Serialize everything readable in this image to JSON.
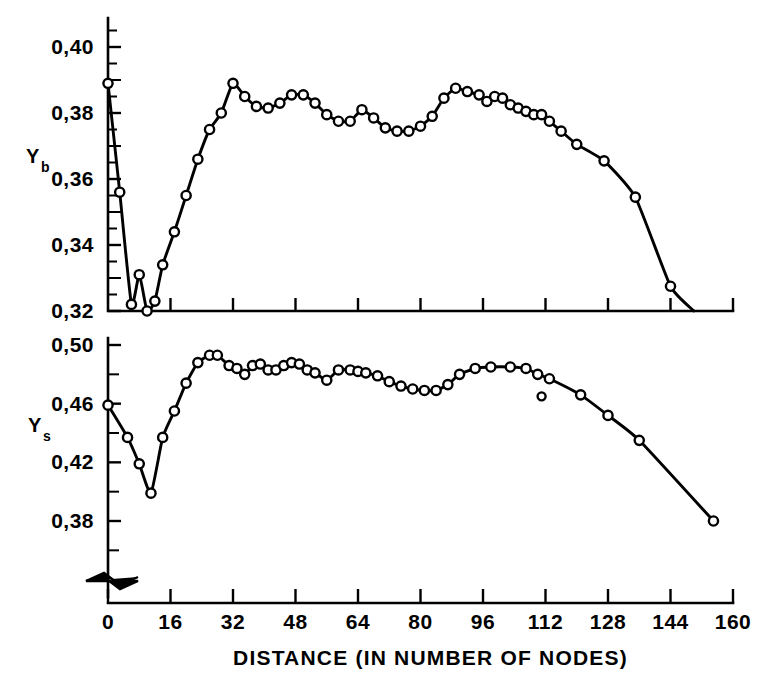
{
  "figure": {
    "background_color": "#ffffff",
    "line_color": "#000000",
    "marker_fill_color": "#ffffff"
  },
  "xaxis": {
    "title": "DISTANCE (IN NUMBER OF NODES)",
    "tick_labels": [
      "0",
      "16",
      "32",
      "48",
      "64",
      "80",
      "96",
      "112",
      "128",
      "144",
      "160"
    ],
    "tick_values": [
      0,
      16,
      32,
      48,
      64,
      80,
      96,
      112,
      128,
      144,
      160
    ],
    "range": [
      0,
      160
    ]
  },
  "panels": {
    "top": {
      "axis_label_main": "Y",
      "axis_label_sub": "b",
      "tick_labels": [
        "0,40",
        "0,38",
        "0,36",
        "0,34",
        "0,32"
      ],
      "tick_values": [
        0.4,
        0.38,
        0.36,
        0.34,
        0.32
      ],
      "range": [
        0.32,
        0.408
      ],
      "minor_tick_step": 0.01
    },
    "bottom": {
      "axis_label_main": "Y",
      "axis_label_sub": "s",
      "tick_labels": [
        "0,50",
        "0,46",
        "0,42",
        "0,38"
      ],
      "tick_values": [
        0.5,
        0.46,
        0.42,
        0.38
      ],
      "range": [
        0.355,
        0.503
      ],
      "minor_tick_step": 0.02,
      "axis_break": "zigzag-break"
    }
  },
  "chart_data": [
    {
      "type": "line",
      "title": "",
      "name": "Yb versus distance",
      "xlabel": "DISTANCE (IN NUMBER OF NODES)",
      "ylabel": "Yb",
      "xlim": [
        0,
        160
      ],
      "ylim": [
        0.32,
        0.408
      ],
      "grid": false,
      "legend": "none",
      "marker": "open-circle",
      "x": [
        0,
        3,
        6,
        8,
        10,
        12,
        14,
        17,
        20,
        23,
        26,
        29,
        32,
        35,
        38,
        41,
        44,
        47,
        50,
        53,
        56,
        59,
        62,
        65,
        68,
        71,
        74,
        77,
        80,
        83,
        86,
        89,
        92,
        95,
        97,
        99,
        101,
        103,
        105,
        107,
        109,
        111,
        113,
        116,
        120,
        127,
        135,
        144,
        150
      ],
      "y": [
        0.389,
        0.356,
        0.322,
        0.331,
        0.32,
        0.323,
        0.334,
        0.344,
        0.355,
        0.366,
        0.375,
        0.38,
        0.389,
        0.385,
        0.382,
        0.3815,
        0.383,
        0.3855,
        0.3855,
        0.383,
        0.3795,
        0.3775,
        0.3775,
        0.381,
        0.3785,
        0.3755,
        0.3745,
        0.3745,
        0.376,
        0.379,
        0.3845,
        0.3875,
        0.3865,
        0.3855,
        0.3835,
        0.385,
        0.3845,
        0.3825,
        0.3815,
        0.3805,
        0.3795,
        0.3795,
        0.3775,
        0.3745,
        0.3705,
        0.3655,
        0.3545,
        0.3275,
        0.32
      ]
    },
    {
      "type": "line",
      "title": "",
      "name": "Ys versus distance",
      "xlabel": "DISTANCE (IN NUMBER OF NODES)",
      "ylabel": "Ys",
      "xlim": [
        0,
        160
      ],
      "ylim": [
        0.355,
        0.503
      ],
      "grid": false,
      "legend": "none",
      "marker": "open-circle",
      "x": [
        0,
        5,
        8,
        11,
        14,
        17,
        20,
        23,
        26,
        28,
        31,
        33,
        35,
        37,
        39,
        41,
        43,
        45,
        47,
        49,
        51,
        53,
        56,
        59,
        62,
        64,
        66,
        69,
        72,
        75,
        78,
        81,
        84,
        87,
        90,
        94,
        98,
        103,
        107,
        110,
        111,
        113,
        121,
        128,
        136,
        155
      ],
      "y": [
        0.459,
        0.437,
        0.419,
        0.399,
        0.437,
        0.455,
        0.474,
        0.488,
        0.493,
        0.493,
        0.486,
        0.484,
        0.48,
        0.486,
        0.487,
        0.483,
        0.483,
        0.486,
        0.488,
        0.487,
        0.483,
        0.481,
        0.476,
        0.483,
        0.483,
        0.482,
        0.481,
        0.479,
        0.475,
        0.472,
        0.47,
        0.469,
        0.469,
        0.473,
        0.48,
        0.484,
        0.485,
        0.485,
        0.484,
        0.48,
        0.465,
        0.477,
        0.466,
        0.452,
        0.435,
        0.38
      ]
    }
  ]
}
